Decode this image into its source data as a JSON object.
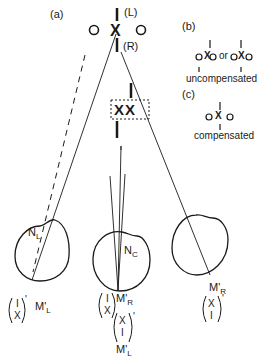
{
  "panels": {
    "a": {
      "label": "(a)"
    },
    "b": {
      "label": "(b)",
      "or_text": "or",
      "caption": "uncompensated"
    },
    "c": {
      "label": "(c)",
      "caption": "compensated"
    }
  },
  "fixation": {
    "left_marker": "(L)",
    "right_marker": "(R)",
    "cross": "X"
  },
  "doubled_image": {
    "text": "XX"
  },
  "eyes": {
    "left": {
      "node_label": "N",
      "node_sub": "L",
      "image_label": "M'",
      "image_sub": "L",
      "bracket_top": "I",
      "bracket_bottom": "X",
      "prime": "'"
    },
    "center": {
      "node_label": "N",
      "node_sub": "C",
      "image_r_label": "M'",
      "image_r_sub": "R",
      "image_l_label": "M'",
      "image_l_sub": "L",
      "bracket1_top": "I",
      "bracket1_bottom": "X",
      "bracket2_top": "X",
      "bracket2_bottom": "I",
      "prime": "'"
    },
    "right": {
      "image_label": "M'",
      "image_sub": "R",
      "bracket_top": "X",
      "bracket_bottom": "I",
      "prime": "'"
    }
  },
  "colors": {
    "ink": "#1a1a1a",
    "background": "#ffffff"
  }
}
